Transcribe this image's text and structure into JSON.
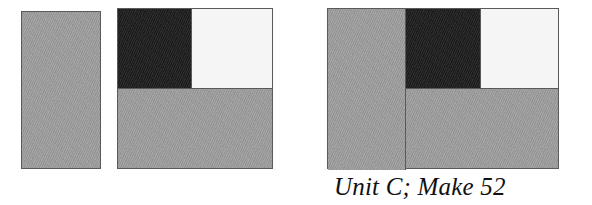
{
  "figure": {
    "caption": "Unit C; Make 52",
    "palette": {
      "gray": "#9a9a9a",
      "dark": "#1f1f1f",
      "light": "#f5f5f5",
      "outline": "#5a5a5a",
      "background": "#ffffff"
    },
    "shapes": [
      {
        "name": "figure-one",
        "role": "unit-rectangle",
        "description": "tall plain gray rectangle",
        "parts": [
          {
            "name": "gray-panel",
            "fill": "gray"
          }
        ]
      },
      {
        "name": "figure-two",
        "role": "quartered-square",
        "description": "square divided into dark top-left, light top-right, gray bottom band",
        "parts": [
          {
            "name": "dark-quadrant",
            "fill": "dark"
          },
          {
            "name": "light-quadrant",
            "fill": "light"
          },
          {
            "name": "gray-lower-band",
            "fill": "gray"
          }
        ]
      },
      {
        "name": "figure-three",
        "role": "composite-assembly",
        "description": "gray rectangle joined at left of the quartered square",
        "parts": [
          {
            "name": "gray-left-panel",
            "fill": "gray"
          },
          {
            "name": "dark-quadrant",
            "fill": "dark"
          },
          {
            "name": "light-quadrant",
            "fill": "light"
          },
          {
            "name": "gray-lower-band",
            "fill": "gray"
          }
        ]
      }
    ]
  }
}
